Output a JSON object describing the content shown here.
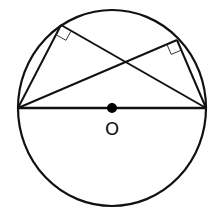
{
  "diagram": {
    "type": "geometry",
    "center_label": "O",
    "stroke_color": "#111111",
    "background": "#ffffff",
    "circle": {
      "cx": 112,
      "cy": 108,
      "rx": 94,
      "ry": 98
    },
    "diameter": {
      "x1": 18,
      "y1": 108,
      "x2": 206,
      "y2": 108
    },
    "center_point": {
      "cx": 112,
      "cy": 108,
      "r": 5
    },
    "vertices": {
      "A": {
        "x": 18,
        "y": 108
      },
      "B": {
        "x": 206,
        "y": 108
      },
      "P": {
        "x": 61,
        "y": 25
      },
      "Q": {
        "x": 177,
        "y": 40
      }
    },
    "right_angle_marks": [
      {
        "at": "P",
        "size": 11
      },
      {
        "at": "Q",
        "size": 11
      }
    ]
  }
}
